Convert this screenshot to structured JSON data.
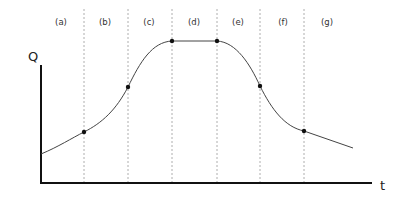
{
  "diagram": {
    "y_axis_label": "Q",
    "x_axis_label": "t",
    "phases": [
      {
        "label": "(a)",
        "x": 61
      },
      {
        "label": "(b)",
        "x": 105
      },
      {
        "label": "(c)",
        "x": 149
      },
      {
        "label": "(d)",
        "x": 194
      },
      {
        "label": "(e)",
        "x": 238
      },
      {
        "label": "(f)",
        "x": 283
      },
      {
        "label": "(g)",
        "x": 327
      }
    ],
    "dividers_x": [
      84,
      128,
      172,
      217,
      260,
      304
    ],
    "points": [
      {
        "x": 84,
        "y": 132
      },
      {
        "x": 128,
        "y": 87
      },
      {
        "x": 172,
        "y": 41
      },
      {
        "x": 217,
        "y": 41
      },
      {
        "x": 260,
        "y": 86
      },
      {
        "x": 304,
        "y": 131
      }
    ],
    "curve_path": "M41,154 C58,147 72,138 84,132 C102,123 116,110 128,87 C140,62 152,42 172,41 L217,41 C236,42 250,64 260,86 C272,110 285,127 304,131 L353,148",
    "colors": {
      "axis": "#111111",
      "curve": "#444444",
      "divider": "#9a9a9a"
    }
  }
}
